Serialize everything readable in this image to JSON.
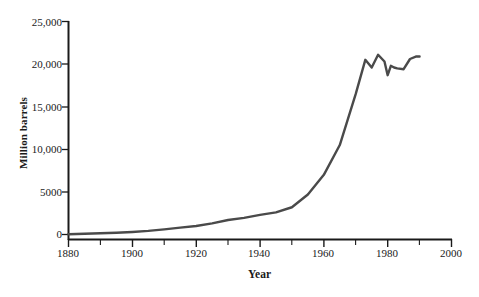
{
  "figure": {
    "background_color": "#ffffff",
    "axis_color": "#1a1a1a",
    "line_color": "#4a4a4a"
  },
  "chart_data": {
    "type": "line",
    "title": "",
    "subtitle": "",
    "xlabel": "Year",
    "ylabel": "Million barrels",
    "xlim": [
      1880,
      2000
    ],
    "ylim": [
      0,
      25000
    ],
    "xticks": [
      1880,
      1900,
      1920,
      1940,
      1960,
      1980,
      2000
    ],
    "xtick_labels": [
      "1880",
      "1900",
      "1920",
      "1940",
      "1960",
      "1980",
      "2000"
    ],
    "x_minor_tick_interval": 10,
    "yticks": [
      0,
      5000,
      10000,
      15000,
      20000,
      25000
    ],
    "ytick_labels": [
      "0",
      "5000",
      "10,000",
      "15,000",
      "20,000",
      "25,000"
    ],
    "grid": false,
    "legend": null,
    "legend_position": "none",
    "series": [
      {
        "name": "World crude oil production",
        "x": [
          1880,
          1885,
          1890,
          1895,
          1900,
          1905,
          1910,
          1915,
          1920,
          1925,
          1930,
          1935,
          1940,
          1945,
          1950,
          1955,
          1960,
          1965,
          1970,
          1973,
          1975,
          1977,
          1979,
          1980,
          1981,
          1982,
          1983,
          1985,
          1987,
          1989,
          1990
        ],
        "values": [
          30,
          80,
          140,
          200,
          300,
          420,
          600,
          800,
          1000,
          1300,
          1700,
          1950,
          2300,
          2600,
          3200,
          4700,
          7000,
          10500,
          16500,
          20500,
          19600,
          21100,
          20300,
          18700,
          19800,
          19600,
          19500,
          19400,
          20600,
          20900,
          20900
        ]
      }
    ],
    "annotations": []
  }
}
